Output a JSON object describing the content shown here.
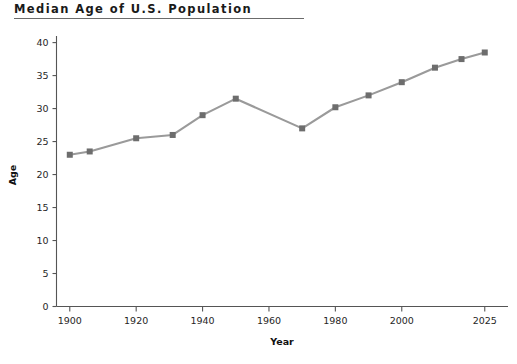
{
  "chart_data": {
    "type": "line",
    "title": "Median Age of U.S. Population",
    "xlabel": "Year",
    "ylabel": "Age",
    "x": [
      1900,
      1906,
      1920,
      1931,
      1940,
      1950,
      1970,
      1980,
      1990,
      2000,
      2010,
      2018,
      2025
    ],
    "values": [
      23.0,
      23.5,
      25.5,
      26.0,
      29.0,
      31.5,
      27.0,
      30.2,
      32.0,
      34.0,
      36.2,
      37.5,
      38.5
    ],
    "series": [
      {
        "name": "Median Age",
        "values": [
          23.0,
          23.5,
          25.5,
          26.0,
          29.0,
          31.5,
          27.0,
          30.2,
          32.0,
          34.0,
          36.2,
          37.5,
          38.5
        ]
      }
    ],
    "xlim": [
      1896,
      2032
    ],
    "ylim": [
      0,
      41
    ],
    "xticks": [
      1900,
      1920,
      1940,
      1960,
      1980,
      2000,
      2025
    ],
    "xtick_labels": [
      "1900",
      "1920",
      "1940",
      "1960",
      "1980",
      "2000",
      "2025"
    ],
    "yticks": [
      0,
      5,
      10,
      15,
      20,
      25,
      30,
      35,
      40
    ],
    "ytick_labels": [
      "0",
      "5",
      "10",
      "15",
      "20",
      "25",
      "30",
      "35",
      "40"
    ],
    "grid": false,
    "legend": "none",
    "line_color": "#9a9a9a",
    "marker_color": "#6d6d6d",
    "marker_shape": "square",
    "axis_color": "#555555",
    "title_rule_color": "#6b6b6b"
  }
}
